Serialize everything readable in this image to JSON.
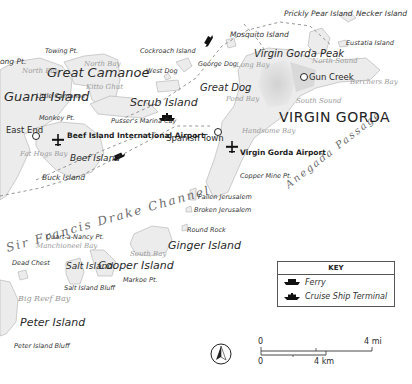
{
  "map": {
    "title_region": "Virgin Gorda & surrounding British Virgin Islands",
    "regions": {
      "virgin_gorda": "VIRGIN GORDA"
    },
    "islands": {
      "guana": "Guana Island",
      "great_camanoe": "Great Camanoe",
      "scrub": "Scrub Island",
      "beef": "Beef Island",
      "great_dog": "Great Dog",
      "ginger": "Ginger Island",
      "cooper": "Cooper Island",
      "salt": "Salt Island",
      "peter": "Peter Island",
      "mosquito": "Mosquito Island",
      "prickly_pear": "Prickly Pear Island",
      "necker": "Necker Island",
      "eustatia": "Eustatia Island",
      "cockroach": "Cockroach Island",
      "west_dog": "West Dog",
      "george_dog": "George Dog",
      "little_camanoe": "Little Camanoe",
      "buck": "Buck Island",
      "dead_chest": "Dead Chest",
      "fallen_jerusalem": "Fallen Jerusalem",
      "broken_jerusalem": "Broken Jerusalem",
      "round_rock": "Round Rock"
    },
    "points": {
      "long_pt": "ong Pt.",
      "towing_pt": "Towing Pt.",
      "monkey_pt": "Monkey Pt.",
      "copper_mine_pt": "Copper Mine Pt.",
      "quart_a_nancy_pt": "Quart-a-Nancy Pt.",
      "markoe_pt": "Markoe Pt.",
      "salt_island_bluff": "Salt Island Bluff",
      "peter_island_bluff": "Peter Island Bluff",
      "virgin_gorda_peak": "Virgin Gorda Peak",
      "pussers_marina": "Pusser's Marina Cay"
    },
    "towns": {
      "east_end": "East End",
      "spanish_town": "Spanish Town",
      "gun_creek": "Gun Creek"
    },
    "airports": {
      "beef_island": "Beef Island International Airport",
      "virgin_gorda": "Virgin Gorda Airport"
    },
    "bays": {
      "north_bay_west": "North Bay",
      "north_bay_east": "North Bay",
      "kitto_ghut": "Kitto Ghut",
      "fat_hogs": "Fat Hogs Bay",
      "long_bay": "Long Bay",
      "pond_bay": "Pond Bay",
      "handsome_bay": "Handsome Bay",
      "north_sound": "North Sound",
      "south_sound": "South Sound",
      "berchers_bay": "Berchers Bay",
      "south_bay": "South Bay",
      "manchioneel_bay": "Manchioneel Bay",
      "big_reef_bay": "Big Reef Bay"
    },
    "water": {
      "drake_channel": "Sir Francis Drake Channel",
      "anegada_passage": "Anegada Passage"
    }
  },
  "key": {
    "title": "KEY",
    "items": [
      {
        "symbol": "ferry-icon",
        "label": "Ferry"
      },
      {
        "symbol": "cruise-ship-icon",
        "label": "Cruise Ship Terminal"
      }
    ]
  },
  "scale": {
    "mi_start": "0",
    "mi_end": "4 mi",
    "km_start": "0",
    "km_end": "4 km"
  },
  "compass": {
    "symbol": "north-arrow-icon"
  },
  "colors": {
    "land": "#e9e9e9",
    "land_stroke": "#b9b9b9",
    "relief": "#d6d6d6",
    "water": "#ffffff",
    "route": "#8a8a8a",
    "text": "#2a2a2a",
    "bay_text": "#9a9a9a"
  }
}
